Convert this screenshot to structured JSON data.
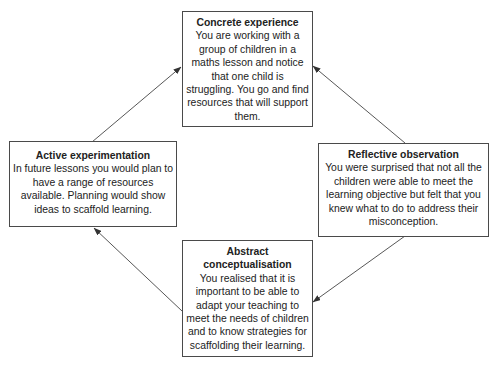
{
  "diagram": {
    "type": "cycle",
    "nodes": [
      {
        "id": "concrete",
        "title": "Concrete experience",
        "body": "You are working with a group of children in a maths lesson and notice that one child is struggling. You go and find resources that will support them."
      },
      {
        "id": "reflective",
        "title": "Reflective observation",
        "body": "You were surprised that not all the children were able to meet the learning objective but felt that you knew what to do to address their misconception."
      },
      {
        "id": "abstract",
        "title": "Abstract conceptualisation",
        "body": "You realised that it is important to be able to adapt your teaching to meet the needs of children and to know strategies for scaffolding their learning."
      },
      {
        "id": "active",
        "title": "Active experimentation",
        "body": "In future lessons you would plan to have a range of resources available. Planning would show ideas to scaffold learning."
      }
    ],
    "edges": [
      {
        "from": "concrete",
        "to": "reflective"
      },
      {
        "from": "reflective",
        "to": "abstract"
      },
      {
        "from": "abstract",
        "to": "active"
      },
      {
        "from": "active",
        "to": "concrete"
      }
    ]
  }
}
